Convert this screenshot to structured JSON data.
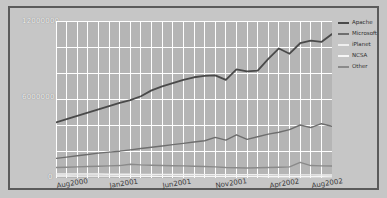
{
  "chart_data": {
    "type": "line",
    "title": "",
    "xlabel": "",
    "ylabel": "",
    "ylim": [
      0,
      12000000
    ],
    "grid": true,
    "legend_position": "right",
    "y_ticks": [
      "0",
      "6000000",
      "12000000"
    ],
    "y_tick_values": [
      0,
      6000000,
      12000000
    ],
    "x_ticks": [
      "Aug2000",
      "Jan2001",
      "Jun2001",
      "Nov2001",
      "Apr2002",
      "Aug2002"
    ],
    "x_tick_indices": [
      2,
      7,
      12,
      17,
      22,
      26
    ],
    "x": [
      "Jun2000",
      "Jul2000",
      "Aug2000",
      "Sep2000",
      "Oct2000",
      "Nov2000",
      "Dec2000",
      "Jan2001",
      "Feb2001",
      "Mar2001",
      "Apr2001",
      "May2001",
      "Jun2001",
      "Jul2001",
      "Aug2001",
      "Sep2001",
      "Oct2001",
      "Nov2001",
      "Dec2001",
      "Jan2002",
      "Feb2002",
      "Mar2002",
      "Apr2002",
      "May2002",
      "Jun2002",
      "Jul2002",
      "Aug2002"
    ],
    "series": [
      {
        "name": "Apache",
        "color": "#4a4a4a",
        "values": [
          4250000,
          4500000,
          4750000,
          5000000,
          5250000,
          5500000,
          5750000,
          5950000,
          6250000,
          6700000,
          7000000,
          7250000,
          7500000,
          7700000,
          7800000,
          7850000,
          7500000,
          8300000,
          8150000,
          8200000,
          9100000,
          9900000,
          9500000,
          10300000,
          10500000,
          10400000,
          11000000
        ]
      },
      {
        "name": "Microsoft",
        "color": "#6e6e6e",
        "values": [
          1500000,
          1600000,
          1700000,
          1800000,
          1900000,
          1980000,
          2050000,
          2150000,
          2250000,
          2350000,
          2450000,
          2550000,
          2650000,
          2750000,
          2850000,
          3100000,
          2900000,
          3300000,
          2950000,
          3150000,
          3350000,
          3500000,
          3700000,
          4050000,
          3850000,
          4150000,
          3950000
        ]
      },
      {
        "name": "iPlanet",
        "color": "#efefef",
        "values": [
          300000,
          300000,
          300000,
          300000,
          300000,
          290000,
          290000,
          290000,
          280000,
          280000,
          280000,
          270000,
          270000,
          270000,
          260000,
          260000,
          260000,
          250000,
          250000,
          250000,
          250000,
          240000,
          240000,
          240000,
          240000,
          230000,
          230000
        ]
      },
      {
        "name": "NCSA",
        "color": "#f6f6f6",
        "values": [
          150000,
          150000,
          145000,
          145000,
          140000,
          140000,
          135000,
          135000,
          130000,
          130000,
          125000,
          125000,
          120000,
          120000,
          115000,
          115000,
          110000,
          110000,
          105000,
          105000,
          100000,
          100000,
          95000,
          95000,
          90000,
          90000,
          85000
        ]
      },
      {
        "name": "Other",
        "color": "#8a8a8a",
        "values": [
          800000,
          820000,
          850000,
          880000,
          900000,
          930000,
          950000,
          1050000,
          1000000,
          980000,
          960000,
          940000,
          930000,
          900000,
          880000,
          850000,
          800000,
          780000,
          760000,
          780000,
          800000,
          820000,
          850000,
          1200000,
          950000,
          930000,
          920000
        ]
      }
    ]
  }
}
